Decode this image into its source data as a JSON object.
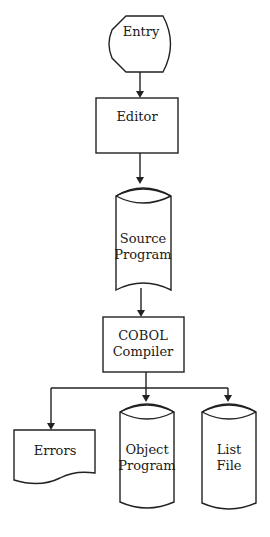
{
  "diagram": {
    "type": "flowchart",
    "nodes": {
      "entry": {
        "shape": "terminal",
        "label": "Entry"
      },
      "editor": {
        "shape": "process",
        "label": "Editor"
      },
      "source": {
        "shape": "storage",
        "lines": [
          "Source",
          "Program"
        ]
      },
      "compiler": {
        "shape": "process",
        "lines": [
          "COBOL",
          "Compiler"
        ]
      },
      "errors": {
        "shape": "document",
        "label": "Errors"
      },
      "object": {
        "shape": "storage",
        "lines": [
          "Object",
          "Program"
        ]
      },
      "list": {
        "shape": "storage",
        "lines": [
          "List",
          "File"
        ]
      }
    },
    "edges": [
      {
        "from": "Entry",
        "to": "Editor"
      },
      {
        "from": "Editor",
        "to": "Source Program"
      },
      {
        "from": "Source Program",
        "to": "COBOL Compiler"
      },
      {
        "from": "COBOL Compiler",
        "to": "Errors"
      },
      {
        "from": "COBOL Compiler",
        "to": "Object Program"
      },
      {
        "from": "COBOL Compiler",
        "to": "List File"
      }
    ],
    "colors": {
      "stroke": "#222222",
      "fill": "#ffffff",
      "text": "#1a1a1a"
    }
  }
}
